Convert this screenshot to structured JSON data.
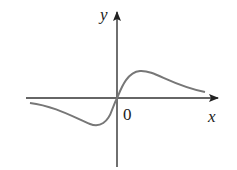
{
  "figure": {
    "type": "function-graph",
    "axes": {
      "x_label": "x",
      "y_label": "y",
      "origin_label": "0"
    },
    "curve": {
      "description": "odd function, local min left of origin, local max right of origin, approaching 0 at both ends",
      "color": "#777777"
    },
    "axis_color": "#333333"
  }
}
